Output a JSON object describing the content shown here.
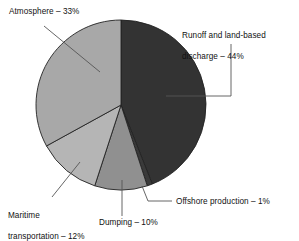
{
  "chart_data": {
    "type": "pie",
    "title": "",
    "subtitle": "",
    "xlabel": "",
    "ylabel": "",
    "legend_position": "none",
    "grid": false,
    "units": "percent",
    "total": 100,
    "start_angle_deg": 0,
    "direction": "clockwise",
    "categories": [
      "Runoff and land-based discharge",
      "Offshore production",
      "Dumping",
      "Maritime transportation",
      "Atmosphere"
    ],
    "values": [
      44,
      1,
      10,
      12,
      33
    ],
    "colors": [
      "#333333",
      "#3a3a3a",
      "#909090",
      "#b5b5b5",
      "#a8a8a8"
    ],
    "slices": [
      {
        "name": "Runoff and land-based discharge",
        "value": 44,
        "label": "Runoff and land-based\ndischarge – 44%",
        "color": "#333333"
      },
      {
        "name": "Offshore production",
        "value": 1,
        "label": "Offshore production – 1%",
        "color": "#3a3a3a"
      },
      {
        "name": "Dumping",
        "value": 10,
        "label": "Dumping – 10%",
        "color": "#909090"
      },
      {
        "name": "Maritime transportation",
        "value": 12,
        "label": "Maritime\ntransportation – 12%",
        "color": "#b5b5b5"
      },
      {
        "name": "Atmosphere",
        "value": 33,
        "label": "Atmosphere – 33%",
        "color": "#a8a8a8"
      }
    ]
  },
  "figure": {
    "background_color": "#ffffff",
    "stroke_color": "#222222",
    "leader_line_color": "#555555",
    "center_x": 121,
    "center_y": 105,
    "radius": 85
  },
  "labels": {
    "atmosphere": "Atmosphere – 33%",
    "runoff_line1": "Runoff and land-based",
    "runoff_line2": "discharge – 44%",
    "offshore": "Offshore production – 1%",
    "dumping": "Dumping – 10%",
    "maritime_line1": "Maritime",
    "maritime_line2": "transportation – 12%"
  }
}
